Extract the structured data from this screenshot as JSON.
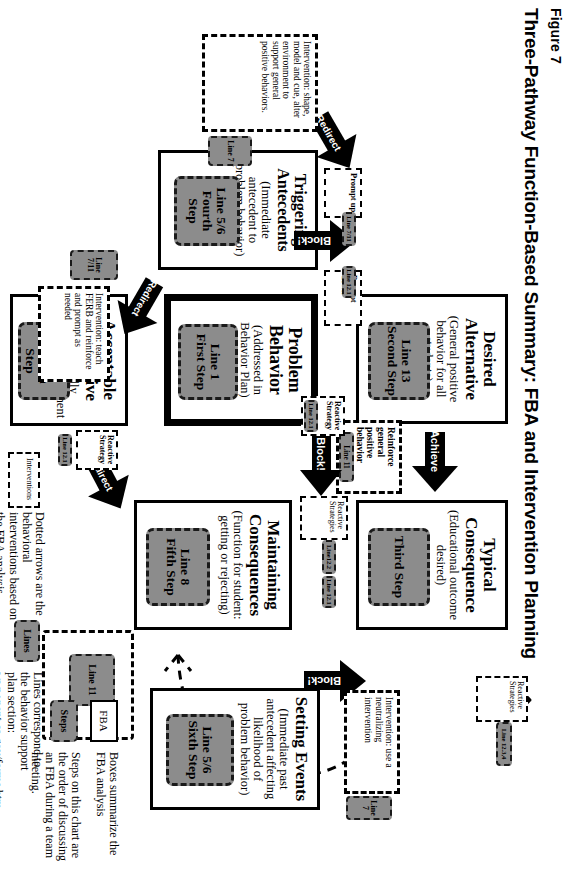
{
  "figure": {
    "number": "Figure 7",
    "title": "Three-Pathway Function-Based Summary: FBA and Intervention Planning"
  },
  "boxes": {
    "desired_alternative": {
      "title": "Desired\nAlternative",
      "subtitle": "(General positive behavior for all students)",
      "step": "Line 13\nSecond Step"
    },
    "typical_consequence": {
      "title": "Typical\nConsequence",
      "subtitle": "(Educational outcome desired)",
      "step": "Third Step"
    },
    "problem_behavior": {
      "title": "Problem\nBehavior",
      "subtitle": "(Addressed in Behavior Plan)",
      "step": "Line 1\nFirst Step"
    },
    "maintaining_consequences": {
      "title": "Maintaining\nConsequences",
      "subtitle": "(Function for student: getting or rejecting)",
      "step": "Line 8\nFifth Step"
    },
    "acceptable_alternative": {
      "title": "Acceptable\nAlternative",
      "subtitle": "(Functionally equivalent replacement behavior)",
      "step": "Line 9\nSeventh Step"
    },
    "triggering_antecedents": {
      "title": "Triggering\nAntecedents",
      "subtitle": "(Immediate antecedent to problem behavior)",
      "step": "Line 5/6\nFourth Step"
    },
    "setting_events": {
      "title": "Setting Events",
      "subtitle": "(Immediate past antecedent affecting likelihood of problem behavior)",
      "step": "Line 5/6\nSixth Step"
    }
  },
  "arrows": {
    "achieve": "Achieve",
    "block_top": "Block!",
    "block_bottom": "Block!",
    "block_setting": "Block!",
    "redirect_left": "Redirect",
    "redirect_right": "Redirect",
    "redirect_far_right": "Redirect"
  },
  "callouts": {
    "reinforce_positive": {
      "text": "Reinforce general positive behavior",
      "step": "Line 11"
    },
    "reactive_left": {
      "text": "Reactive Strategy",
      "step": "Line 12.1"
    },
    "reactive_right": {
      "text": "Reactive Strategies",
      "step": "Line12.2",
      "step2": "Line 12.1"
    },
    "reactive_top": {
      "text": "Reactive Strategies",
      "step": "Line 12.3,4"
    },
    "reactive_far_right": {
      "text": "Reactive Strategy",
      "step": "Line 12.1"
    },
    "prompt_up": {
      "text": "Prompt up",
      "step": "Line 7/11"
    },
    "prompt_down": {
      "text": "Prompt down",
      "step": "Line 12.1"
    },
    "shape_model": {
      "text": "Intervention: shape, model and cue, alter environment to support general positive behaviors.",
      "step": "Line 7"
    },
    "teach_ferb": {
      "text": "Intervention: teach FERB and reinforce and prompt as needed",
      "step": "Line 7/11"
    },
    "neutralizing": {
      "text": "Intervention: use a neutralizing intervention",
      "step": "Line 7"
    },
    "redirect_step": {
      "step": "Line 11"
    }
  },
  "legend": {
    "items": [
      {
        "key": "FBA",
        "desc": "Boxes summarize the FBA analysis"
      },
      {
        "key": "Steps",
        "desc": "Steps on this chart are the order of discussing an FBA during a team meeting."
      },
      {
        "key": "Lines",
        "desc": "Lines correspond to the behavior support plan section: www.pent.ca.gov/forms.htm"
      },
      {
        "key": "Interventions",
        "desc": "Dotted arrows are the behavioral interventions based on the FBA analysis."
      }
    ]
  },
  "colors": {
    "chip_fill": "#8c8c8c",
    "line": "#000000",
    "background": "#ffffff"
  }
}
